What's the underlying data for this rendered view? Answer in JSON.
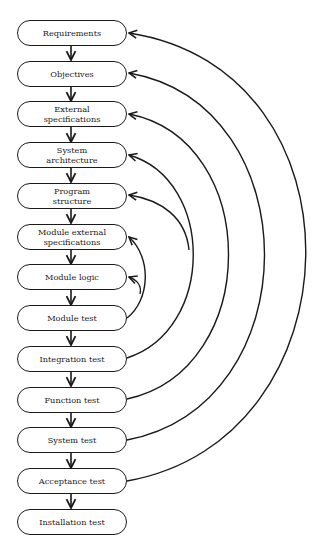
{
  "diagram": {
    "type": "flowchart",
    "stages": [
      {
        "id": "requirements",
        "label": "Requirements"
      },
      {
        "id": "objectives",
        "label": "Objectives"
      },
      {
        "id": "external-specifications",
        "label": "External\nspecifications"
      },
      {
        "id": "system-architecture",
        "label": "System\narchitecture"
      },
      {
        "id": "program-structure",
        "label": "Program\nstructure"
      },
      {
        "id": "module-external-specifications",
        "label": "Module external\nspecifications"
      },
      {
        "id": "module-logic",
        "label": "Module logic"
      },
      {
        "id": "module-test",
        "label": "Module test"
      },
      {
        "id": "integration-test",
        "label": "Integration test"
      },
      {
        "id": "function-test",
        "label": "Function test"
      },
      {
        "id": "system-test",
        "label": "System test"
      },
      {
        "id": "acceptance-test",
        "label": "Acceptance test"
      },
      {
        "id": "installation-test",
        "label": "Installation test"
      }
    ],
    "sequential_edges": [
      [
        "requirements",
        "objectives"
      ],
      [
        "objectives",
        "external-specifications"
      ],
      [
        "external-specifications",
        "system-architecture"
      ],
      [
        "system-architecture",
        "program-structure"
      ],
      [
        "program-structure",
        "module-external-specifications"
      ],
      [
        "module-external-specifications",
        "module-logic"
      ],
      [
        "module-logic",
        "module-test"
      ],
      [
        "module-test",
        "integration-test"
      ],
      [
        "integration-test",
        "function-test"
      ],
      [
        "function-test",
        "system-test"
      ],
      [
        "system-test",
        "acceptance-test"
      ],
      [
        "acceptance-test",
        "installation-test"
      ]
    ],
    "feedback_edges": [
      {
        "from": "acceptance-test",
        "to": [
          "requirements"
        ]
      },
      {
        "from": "system-test",
        "to": [
          "objectives"
        ]
      },
      {
        "from": "function-test",
        "to": [
          "external-specifications"
        ]
      },
      {
        "from": "integration-test",
        "to": [
          "system-architecture",
          "program-structure"
        ]
      },
      {
        "from": "module-test",
        "to": [
          "module-external-specifications",
          "module-logic"
        ]
      }
    ],
    "colors": {
      "stroke": "#1a1a1a",
      "background": "#ffffff"
    }
  }
}
